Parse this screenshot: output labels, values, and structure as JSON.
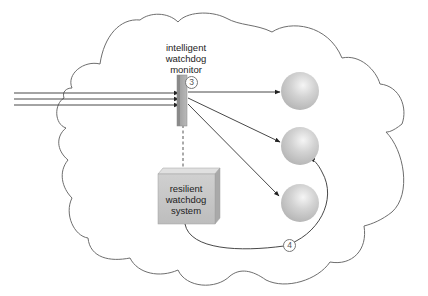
{
  "diagram": {
    "monitor": {
      "label_lines": [
        "intelligent",
        "watchdog",
        "monitor"
      ],
      "marker": "3"
    },
    "system_box": {
      "label_lines": [
        "resilient",
        "watchdog",
        "system"
      ],
      "marker": "4"
    },
    "nodes": [
      {
        "id": "node-1",
        "shape": "sphere"
      },
      {
        "id": "node-2",
        "shape": "sphere"
      },
      {
        "id": "node-3",
        "shape": "sphere"
      }
    ],
    "incoming_arrows": 3,
    "outgoing_arrows": 3,
    "container": "cloud",
    "colors": {
      "outline": "#6e6e6e",
      "arrow": "#333333",
      "monitor_bar": "#a7a7a7",
      "box_face": "#c8c8c8",
      "sphere": "#cfcfcf"
    }
  }
}
